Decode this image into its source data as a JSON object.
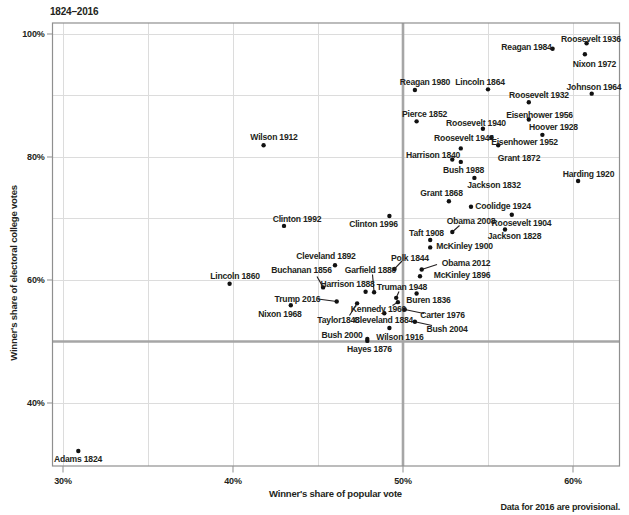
{
  "title": "1824–2016",
  "footnote": "Data for 2016 are provisional.",
  "x_axis": {
    "label": "Winner's share of popular vote",
    "tick_labels": [
      "30%",
      "40%",
      "50%",
      "60%"
    ],
    "tick_values": [
      30,
      40,
      50,
      60
    ],
    "range": [
      29.4,
      62.8
    ]
  },
  "y_axis": {
    "label": "Winner's share of electoral college votes",
    "tick_labels": [
      "40%",
      "60%",
      "80%",
      "100%"
    ],
    "tick_values": [
      40,
      60,
      80,
      100
    ],
    "range": [
      29.8,
      101.8
    ]
  },
  "gridlines": {
    "x_values": [
      30,
      35,
      40,
      45,
      50,
      55,
      60
    ],
    "y_values": [
      40,
      60,
      70,
      80,
      90,
      100
    ]
  },
  "reference_lines": {
    "x_value": 50,
    "y_value": 50
  },
  "colors": {
    "background": "#ffffff",
    "text": "#231f20",
    "gridline": "#dcdcdc",
    "reference_line": "#a6a6a6",
    "border": "#8f8f8f",
    "point": "#111111",
    "leader_line": "#231f20"
  },
  "chart_data": {
    "type": "scatter",
    "title": "1824–2016",
    "xlabel": "Winner's share of popular vote",
    "ylabel": "Winner's share of electoral college votes",
    "xlim": [
      29.4,
      62.8
    ],
    "ylim": [
      29.8,
      101.8
    ],
    "grid": true,
    "points": [
      {
        "label": "Adams 1824",
        "popular_pct": 30.9,
        "electoral_pct": 32.2,
        "label_px": [
          78,
          459
        ],
        "leader_px": null
      },
      {
        "label": "Jackson 1828",
        "popular_pct": 56.0,
        "electoral_pct": 68.2,
        "label_px": [
          514.5,
          236
        ],
        "leader_px": null
      },
      {
        "label": "Jackson 1832",
        "popular_pct": 54.2,
        "electoral_pct": 76.6,
        "label_px": [
          494,
          185
        ],
        "leader_px": null
      },
      {
        "label": "Buren 1836",
        "popular_pct": 50.8,
        "electoral_pct": 57.8,
        "label_px": [
          428.5,
          299.5
        ],
        "leader_px": null
      },
      {
        "label": "Harrison 1840",
        "popular_pct": 52.9,
        "electoral_pct": 79.6,
        "label_px": [
          433,
          155
        ],
        "leader_px": null
      },
      {
        "label": "Polk 1844",
        "popular_pct": 49.5,
        "electoral_pct": 61.8,
        "label_px": [
          410,
          257.5
        ],
        "leader_px": [
          402,
          261
        ]
      },
      {
        "label": "Taylor1848",
        "popular_pct": 47.3,
        "electoral_pct": 56.2,
        "label_px": [
          338.5,
          320
        ],
        "leader_px": [
          349.5,
          315.5
        ]
      },
      {
        "label": "Pierce 1852",
        "popular_pct": 50.8,
        "electoral_pct": 85.8,
        "label_px": [
          424.5,
          113.5
        ],
        "leader_px": null
      },
      {
        "label": "Buchanan 1856",
        "popular_pct": 45.3,
        "electoral_pct": 58.8,
        "label_px": [
          301.5,
          270
        ],
        "leader_px": [
          317,
          276.5
        ]
      },
      {
        "label": "Lincoln 1860",
        "popular_pct": 39.8,
        "electoral_pct": 59.4,
        "label_px": [
          235,
          276
        ],
        "leader_px": null
      },
      {
        "label": "Lincoln 1864",
        "popular_pct": 55.0,
        "electoral_pct": 91.0,
        "label_px": [
          480,
          81.5
        ],
        "leader_px": null
      },
      {
        "label": "Grant 1868",
        "popular_pct": 52.7,
        "electoral_pct": 72.8,
        "label_px": [
          441.5,
          192.5
        ],
        "leader_px": null
      },
      {
        "label": "Grant 1872",
        "popular_pct": 55.6,
        "electoral_pct": 81.9,
        "label_px": [
          519,
          158
        ],
        "leader_px": null
      },
      {
        "label": "Hayes 1876",
        "popular_pct": 47.9,
        "electoral_pct": 50.1,
        "label_px": [
          369.5,
          348.5
        ],
        "leader_px": null
      },
      {
        "label": "Garfield 1880",
        "popular_pct": 48.3,
        "electoral_pct": 58.0,
        "label_px": [
          370.5,
          269.5
        ],
        "leader_px": [
          372.5,
          274.5
        ]
      },
      {
        "label": "Cleveland 1884",
        "popular_pct": 48.9,
        "electoral_pct": 54.6,
        "label_px": [
          383.5,
          320
        ],
        "leader_px": null
      },
      {
        "label": "Harrison 1888",
        "popular_pct": 47.8,
        "electoral_pct": 58.1,
        "label_px": [
          347.5,
          284
        ],
        "leader_px": null
      },
      {
        "label": "Cleveland 1892",
        "popular_pct": 46.0,
        "electoral_pct": 62.4,
        "label_px": [
          326,
          255.5
        ],
        "leader_px": null
      },
      {
        "label": "McKinley 1896",
        "popular_pct": 51.0,
        "electoral_pct": 60.6,
        "label_px": [
          462,
          274.5
        ],
        "leader_px": null
      },
      {
        "label": "McKinley 1900",
        "popular_pct": 51.6,
        "electoral_pct": 65.3,
        "label_px": [
          464.5,
          245.5
        ],
        "leader_px": null
      },
      {
        "label": "Roosevelt 1904",
        "popular_pct": 56.4,
        "electoral_pct": 70.6,
        "label_px": [
          521.5,
          222.5
        ],
        "leader_px": null
      },
      {
        "label": "Taft 1908",
        "popular_pct": 51.6,
        "electoral_pct": 66.5,
        "label_px": [
          426.5,
          232.5
        ],
        "leader_px": null
      },
      {
        "label": "Wilson 1912",
        "popular_pct": 41.8,
        "electoral_pct": 81.9,
        "label_px": [
          274,
          136.5
        ],
        "leader_px": null
      },
      {
        "label": "Wilson 1916",
        "popular_pct": 49.2,
        "electoral_pct": 52.2,
        "label_px": [
          400,
          336.5
        ],
        "leader_px": null
      },
      {
        "label": "Harding 1920",
        "popular_pct": 60.3,
        "electoral_pct": 76.1,
        "label_px": [
          588.5,
          173.5
        ],
        "leader_px": null
      },
      {
        "label": "Coolidge 1924",
        "popular_pct": 54.0,
        "electoral_pct": 71.9,
        "label_px": [
          503,
          205.5
        ],
        "leader_px": null
      },
      {
        "label": "Hoover 1928",
        "popular_pct": 58.2,
        "electoral_pct": 83.6,
        "label_px": [
          553.5,
          126.5
        ],
        "leader_px": null
      },
      {
        "label": "Roosevelt 1932",
        "popular_pct": 57.4,
        "electoral_pct": 88.9,
        "label_px": [
          539,
          95
        ],
        "leader_px": null
      },
      {
        "label": "Roosevelt 1936",
        "popular_pct": 60.8,
        "electoral_pct": 98.5,
        "label_px": [
          591,
          38.5
        ],
        "leader_px": null
      },
      {
        "label": "Roosevelt 1940",
        "popular_pct": 54.7,
        "electoral_pct": 84.6,
        "label_px": [
          476,
          122.5
        ],
        "leader_px": null
      },
      {
        "label": "Roosevelt 1944",
        "popular_pct": 53.4,
        "electoral_pct": 81.4,
        "label_px": [
          464,
          138
        ],
        "leader_px": null
      },
      {
        "label": "Truman 1948",
        "popular_pct": 49.6,
        "electoral_pct": 57.1,
        "label_px": [
          402,
          286.5
        ],
        "leader_px": [
          399,
          291.5
        ]
      },
      {
        "label": "Eisenhower 1952",
        "popular_pct": 55.2,
        "electoral_pct": 83.2,
        "label_px": [
          524.5,
          142
        ],
        "leader_px": null
      },
      {
        "label": "Eisenhower 1956",
        "popular_pct": 57.4,
        "electoral_pct": 86.1,
        "label_px": [
          539.5,
          114.5
        ],
        "leader_px": null
      },
      {
        "label": "Kennedy 1960",
        "popular_pct": 49.7,
        "electoral_pct": 56.4,
        "label_px": [
          378.5,
          309
        ],
        "leader_px": [
          392.5,
          305.5
        ]
      },
      {
        "label": "Johnson 1964",
        "popular_pct": 61.1,
        "electoral_pct": 90.3,
        "label_px": [
          594,
          86.5
        ],
        "leader_px": null
      },
      {
        "label": "Nixon 1968",
        "popular_pct": 43.4,
        "electoral_pct": 55.9,
        "label_px": [
          280,
          313.5
        ],
        "leader_px": null
      },
      {
        "label": "Nixon 1972",
        "popular_pct": 60.7,
        "electoral_pct": 96.7,
        "label_px": [
          594.5,
          63.5
        ],
        "leader_px": null
      },
      {
        "label": "Carter 1976",
        "popular_pct": 50.1,
        "electoral_pct": 55.2,
        "label_px": [
          442.5,
          314.5
        ],
        "leader_px": [
          424,
          313.5
        ]
      },
      {
        "label": "Reagan 1980",
        "popular_pct": 50.7,
        "electoral_pct": 90.9,
        "label_px": [
          425,
          81.5
        ],
        "leader_px": null
      },
      {
        "label": "Reagan 1984",
        "popular_pct": 58.8,
        "electoral_pct": 97.6,
        "label_px": [
          526.5,
          46.5
        ],
        "leader_px": null
      },
      {
        "label": "Bush 1988",
        "popular_pct": 53.4,
        "electoral_pct": 79.2,
        "label_px": [
          463.5,
          170
        ],
        "leader_px": null
      },
      {
        "label": "Clinton 1992",
        "popular_pct": 43.0,
        "electoral_pct": 68.8,
        "label_px": [
          297,
          218.5
        ],
        "leader_px": null
      },
      {
        "label": "Clinton 1996",
        "popular_pct": 49.2,
        "electoral_pct": 70.4,
        "label_px": [
          373.5,
          223.5
        ],
        "leader_px": null
      },
      {
        "label": "Bush 2000",
        "popular_pct": 47.9,
        "electoral_pct": 50.4,
        "label_px": [
          342,
          335
        ],
        "leader_px": null
      },
      {
        "label": "Bush 2004",
        "popular_pct": 50.7,
        "electoral_pct": 53.2,
        "label_px": [
          447,
          328.5
        ],
        "leader_px": [
          432,
          325.5
        ]
      },
      {
        "label": "Obama 2008",
        "popular_pct": 52.9,
        "electoral_pct": 67.8,
        "label_px": [
          471,
          220.5
        ],
        "leader_px": [
          459.5,
          225.5
        ]
      },
      {
        "label": "Obama 2012",
        "popular_pct": 51.1,
        "electoral_pct": 61.7,
        "label_px": [
          466,
          262.5
        ],
        "leader_px": [
          437,
          264.5
        ]
      },
      {
        "label": "Trump 2016",
        "popular_pct": 46.1,
        "electoral_pct": 56.5,
        "label_px": [
          297.5,
          298.5
        ],
        "leader_px": [
          318,
          299
        ]
      }
    ]
  }
}
